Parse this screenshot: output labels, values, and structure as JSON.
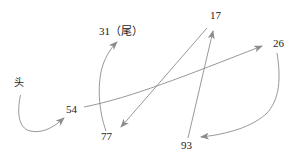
{
  "diagram": {
    "background_color": "#ffffff",
    "stroke_color": "#8c8c8c",
    "text_color": "#1a1a1a",
    "nodes": [
      {
        "id": "head",
        "label": "头",
        "x": 18,
        "y": 86,
        "role": "head-marker"
      },
      {
        "id": "n54",
        "label": "54",
        "x": 70,
        "y": 111,
        "role": "node"
      },
      {
        "id": "n31",
        "label": "31（尾）",
        "x": 99,
        "y": 33,
        "role": "tail-node"
      },
      {
        "id": "n17",
        "label": "17",
        "x": 211,
        "y": 17,
        "role": "node"
      },
      {
        "id": "n26",
        "label": "26",
        "x": 274,
        "y": 45,
        "role": "node"
      },
      {
        "id": "n77",
        "label": "77",
        "x": 104,
        "y": 138,
        "role": "node"
      },
      {
        "id": "n93",
        "label": "93",
        "x": 184,
        "y": 147,
        "role": "node"
      }
    ],
    "edges": [
      {
        "id": "e-head-54",
        "from": "head",
        "to": "n54",
        "arrow": "to"
      },
      {
        "id": "e-54-26",
        "from": "n54",
        "to": "n26",
        "arrow": "to"
      },
      {
        "id": "e-26-93",
        "from": "n26",
        "to": "n93",
        "arrow": "to"
      },
      {
        "id": "e-93-17",
        "from": "n93",
        "to": "n17",
        "arrow": "to"
      },
      {
        "id": "e-17-77",
        "from": "n17",
        "to": "n77",
        "arrow": "to"
      },
      {
        "id": "e-77-31",
        "from": "n77",
        "to": "n31",
        "arrow": "to"
      }
    ],
    "sequence": [
      "头",
      "54",
      "26",
      "93",
      "17",
      "77",
      "31（尾）"
    ]
  }
}
